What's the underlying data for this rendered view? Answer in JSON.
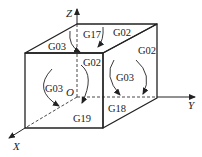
{
  "diagram": {
    "type": "cube-plane-selection",
    "axes": {
      "z": "Z",
      "y": "Y",
      "x": "X",
      "origin": "O"
    },
    "planes": {
      "xy": "G17",
      "zx": "G18",
      "yz": "G19"
    },
    "arc_labels": {
      "top_left": "G03",
      "top_right": "G02",
      "front_cw": "G02",
      "front_ccw": "G03",
      "right_cw": "G02",
      "right_ccw": "G03"
    },
    "colors": {
      "line": "#222222",
      "background": "#ffffff"
    }
  }
}
